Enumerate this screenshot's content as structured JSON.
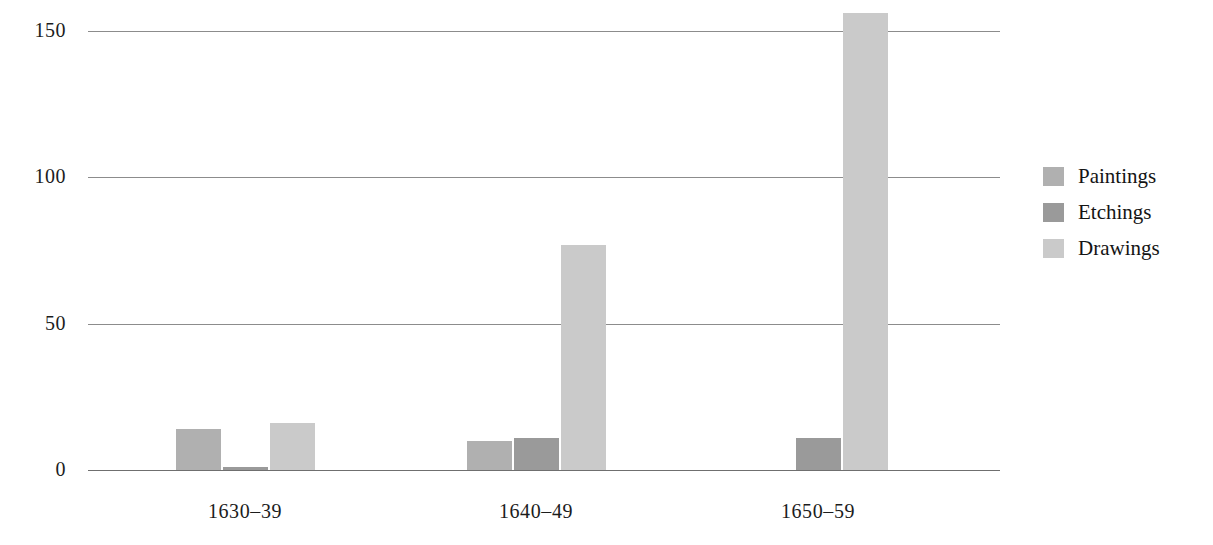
{
  "chart_data": {
    "type": "bar",
    "title": "",
    "subtitle": "",
    "xlabel": "",
    "ylabel": "",
    "categories": [
      "1630–39",
      "1640–49",
      "1650–59"
    ],
    "series": [
      {
        "name": "Paintings",
        "values": [
          14,
          10,
          0
        ],
        "color": "#b0b0b0"
      },
      {
        "name": "Etchings",
        "values": [
          1,
          11,
          11
        ],
        "color": "#9a9a9a"
      },
      {
        "name": "Drawings",
        "values": [
          16,
          77,
          156
        ],
        "color": "#cacaca"
      }
    ],
    "ylim": [
      0,
      160
    ],
    "yticks": [
      0,
      50,
      100,
      150
    ],
    "ytick_labels": [
      "0",
      "50",
      "100",
      "150"
    ],
    "grid": "horizontal",
    "legend_position": "right",
    "annotations": []
  },
  "legend": {
    "items": [
      {
        "label": "Paintings",
        "color": "#b0b0b0"
      },
      {
        "label": "Etchings",
        "color": "#9a9a9a"
      },
      {
        "label": "Drawings",
        "color": "#cacaca"
      }
    ]
  },
  "axis": {
    "y_ticks": [
      "0",
      "50",
      "100",
      "150"
    ],
    "x_ticks": [
      "1630–39",
      "1640–49",
      "1650–59"
    ]
  },
  "colors": {
    "gridline": "#8c8c8c",
    "baseline": "#6f6f6f",
    "text": "#1a1a1a",
    "background": "#ffffff"
  }
}
